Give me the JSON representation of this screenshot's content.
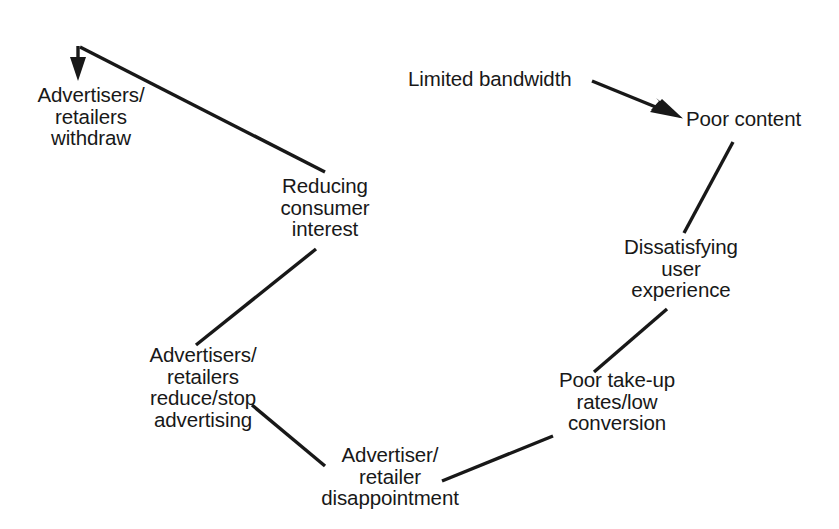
{
  "figure": {
    "background_color": "#ffffff",
    "ink_color": "#181818",
    "width": 839,
    "height": 529
  },
  "nodes": {
    "limited_bandwidth": "Limited bandwidth",
    "poor_content": "Poor content",
    "dissatisfying_ux": "Dissatisfying\nuser\nexperience",
    "poor_take_up": "Poor take-up\nrates/low\nconversion",
    "advertiser_disappointment": "Advertiser/\nretailer\ndisappointment",
    "reduce_stop_advertising": "Advertisers/\nretailers\nreduce/stop\nadvertising",
    "reducing_consumer_interest": "Reducing\nconsumer\ninterest",
    "advertisers_withdraw": "Advertisers/\nretailers\nwithdraw"
  },
  "edges": [
    {
      "name": "limited-bandwidth-to-poor-content",
      "from": "limited_bandwidth",
      "to": "poor_content",
      "arrowhead": true
    },
    {
      "name": "poor-content-to-dissatisfying-ux",
      "from": "poor_content",
      "to": "dissatisfying_ux",
      "arrowhead": false
    },
    {
      "name": "dissatisfying-ux-to-poor-take-up",
      "from": "dissatisfying_ux",
      "to": "poor_take_up",
      "arrowhead": false
    },
    {
      "name": "poor-take-up-to-advertiser-disappointment",
      "from": "poor_take_up",
      "to": "advertiser_disappointment",
      "arrowhead": false
    },
    {
      "name": "advertiser-disappointment-to-reduce-stop-advertising",
      "from": "advertiser_disappointment",
      "to": "reduce_stop_advertising",
      "arrowhead": false
    },
    {
      "name": "reduce-stop-advertising-to-reducing-consumer-interest",
      "from": "reduce_stop_advertising",
      "to": "reducing_consumer_interest",
      "arrowhead": false
    },
    {
      "name": "reducing-consumer-interest-to-advertisers-withdraw",
      "from": "reducing_consumer_interest",
      "to": "advertisers_withdraw",
      "arrowhead": true
    }
  ]
}
